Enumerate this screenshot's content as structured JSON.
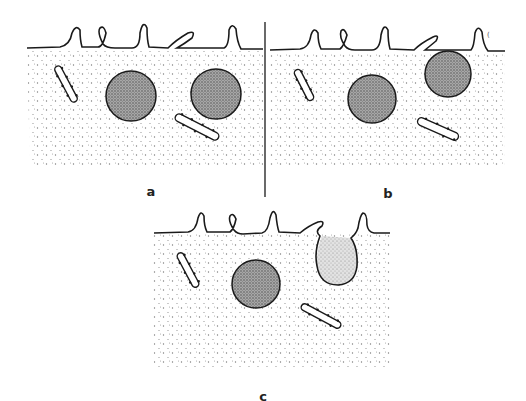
{
  "figure": {
    "colors": {
      "background": "#ffffff",
      "line": "#1a1a1a",
      "stipple": "#777777",
      "particle_fill": "#8a8a8a"
    },
    "panels": [
      {
        "id": "a",
        "label": "a",
        "label_pos": [
          151,
          191
        ],
        "stage": "particle free inside cell, below surface"
      },
      {
        "id": "b",
        "label": "b",
        "label_pos": [
          388,
          193
        ],
        "stage": "particle contacting surface membrane"
      },
      {
        "id": "c",
        "label": "c",
        "label_pos": [
          263,
          396
        ],
        "stage": "particle released, leaving membrane pocket"
      }
    ],
    "divider": {
      "x": 265,
      "y1": 22,
      "y2": 197
    }
  }
}
